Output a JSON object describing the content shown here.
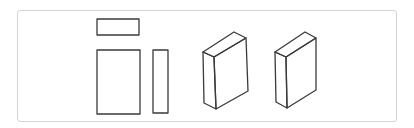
{
  "diagram": {
    "colors": {
      "stroke": "#3a3a3a",
      "frame_border": "#d4d4d4",
      "background": "#ffffff"
    },
    "orthographic_views": [
      {
        "name": "top-view",
        "x": 97,
        "y": 19,
        "width": 42,
        "height": 16
      },
      {
        "name": "front-view",
        "x": 97,
        "y": 50,
        "width": 43,
        "height": 64
      },
      {
        "name": "side-view",
        "x": 153,
        "y": 50,
        "width": 15,
        "height": 63
      }
    ],
    "isometric_views": [
      {
        "name": "block-isometric-1"
      },
      {
        "name": "block-isometric-2"
      }
    ]
  }
}
